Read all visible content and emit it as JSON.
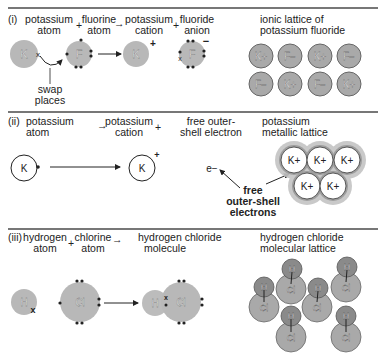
{
  "section1": {
    "roman": "(i)",
    "reactant1": [
      "potassium",
      "atom"
    ],
    "plus1": "+",
    "reactant2": [
      "fluorine",
      "atom"
    ],
    "arrow": "→",
    "product1": [
      "potassium",
      "cation"
    ],
    "plus2": "+",
    "product2": [
      "fluoride",
      "anion"
    ],
    "lattice_title": [
      "ionic lattice of",
      "potassium fluoride"
    ],
    "atom_k": "K",
    "atom_f": "F",
    "cation_charge": "+",
    "anion_charge": "−",
    "electron_mark": "x",
    "annotation": [
      "swap",
      "places"
    ],
    "lattice_row1": [
      "K+",
      "F−",
      "K+",
      "F−"
    ],
    "lattice_row2": [
      "F−",
      "K+",
      "F−",
      "K+"
    ]
  },
  "section2": {
    "roman": "(ii)",
    "reactant1": [
      "potassium",
      "atom"
    ],
    "arrow": "→",
    "product1": [
      "potassium",
      "cation"
    ],
    "plus": "+",
    "product2": [
      "free outer-",
      "shell electron"
    ],
    "lattice_title": [
      "potassium",
      "metallic lattice"
    ],
    "atom_k": "K",
    "cation_charge": "+",
    "electron": "e−",
    "annotation": [
      "free",
      "outer-shell",
      "electrons"
    ],
    "lattice_ions": [
      "K+",
      "K+",
      "K+",
      "K+",
      "K+"
    ]
  },
  "section3": {
    "roman": "(iii)",
    "reactant1": [
      "hydrogen",
      "atom"
    ],
    "plus": "+",
    "reactant2": [
      "chlorine",
      "atom"
    ],
    "arrow": "→",
    "product1": [
      "hydrogen chloride",
      "molecule"
    ],
    "lattice_title": [
      "hydrogen chloride",
      "molecular lattice"
    ],
    "atom_h": "H",
    "atom_cl": "Cl",
    "electron_mark": "x",
    "lattice_molecule": [
      "H",
      "Cl"
    ]
  },
  "colors": {
    "atom_fill": "#b8b8b8",
    "ion_fill": "#a9a9a9",
    "h_fill": "#8a8a8a",
    "line": "#222222",
    "divider": "#777777"
  }
}
